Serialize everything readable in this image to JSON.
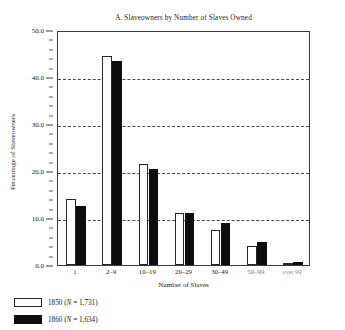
{
  "chart_data": {
    "type": "bar",
    "title": "A. Slaveowners by Number of Slaves Owned",
    "xlabel": "Number of Slaves",
    "ylabel": "Percentage of Slaveowners",
    "categories": [
      "1",
      "2–9",
      "10–19",
      "20–29",
      "30–49",
      "50–99",
      "over 99"
    ],
    "series": [
      {
        "name": "1850",
        "n": "1,731",
        "legend": "1850 (N = 1,731)",
        "color": "#ffffff",
        "values": [
          14.0,
          44.5,
          21.5,
          11.0,
          7.5,
          4.0,
          0.5
        ]
      },
      {
        "name": "1860",
        "n": "1,634",
        "legend": "1860 (N = 1,634)",
        "color": "#0d0d0d",
        "values": [
          12.5,
          43.5,
          20.5,
          11.0,
          9.0,
          5.0,
          0.6
        ]
      }
    ],
    "ylim": [
      0.0,
      50.0
    ],
    "ytick_labels": [
      "50.0",
      "40.0",
      "30.0",
      "20.0",
      "10.0",
      "0.0"
    ],
    "ytick_values": [
      50.0,
      40.0,
      30.0,
      20.0,
      10.0,
      0.0
    ],
    "gridlines": [
      40.0,
      30.0,
      20.0,
      10.0
    ],
    "grid": true,
    "legend_position": "below-left",
    "minor_tick_step": 2.0
  },
  "legend": {
    "items": [
      {
        "label": "1850 (N = 1,731)",
        "year": "1850",
        "n_text": "N = 1,731",
        "swatch": "white"
      },
      {
        "label": "1860 (N = 1,634)",
        "year": "1860",
        "n_text": "N = 1,634",
        "swatch": "black"
      }
    ]
  }
}
